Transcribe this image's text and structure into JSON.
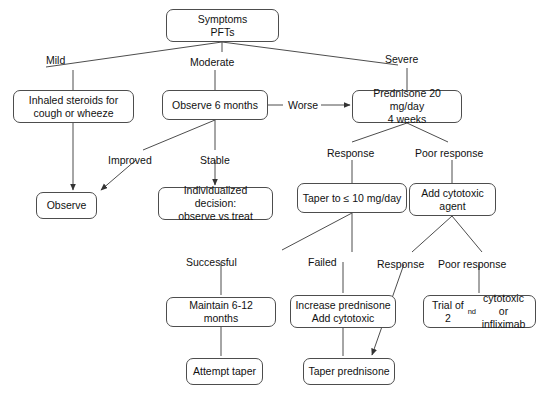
{
  "diagram": {
    "stroke_color": "#4d4d4d",
    "text_color": "#111111",
    "background": "#ffffff",
    "nodes": [
      {
        "id": "symptoms",
        "label": "Symptoms\nPFTs",
        "x": 166,
        "y": 9,
        "w": 113,
        "h": 33
      },
      {
        "id": "inhaled",
        "label": "Inhaled steroids for\ncough or wheeze",
        "x": 13,
        "y": 90,
        "w": 121,
        "h": 33
      },
      {
        "id": "observe6",
        "label": "Observe 6 months",
        "x": 162,
        "y": 90,
        "w": 106,
        "h": 30
      },
      {
        "id": "prednisone",
        "label": "Prednisone 20 mg/day\n4 weeks",
        "x": 352,
        "y": 90,
        "w": 110,
        "h": 33
      },
      {
        "id": "observe",
        "label": "Observe",
        "x": 36,
        "y": 192,
        "w": 61,
        "h": 27
      },
      {
        "id": "individual",
        "label": "Individualized decision:\nobserve vs treat",
        "x": 158,
        "y": 187,
        "w": 115,
        "h": 33
      },
      {
        "id": "taper10",
        "label": "Taper to ≤ 10 mg/day",
        "x": 297,
        "y": 183,
        "w": 110,
        "h": 30
      },
      {
        "id": "addcyto",
        "label": "Add cytotoxic\nagent",
        "x": 409,
        "y": 183,
        "w": 87,
        "h": 33
      },
      {
        "id": "maintain",
        "label": "Maintain 6-12 months",
        "x": 166,
        "y": 297,
        "w": 110,
        "h": 30
      },
      {
        "id": "increase",
        "label": "Increase prednisone\nAdd cytotoxic",
        "x": 290,
        "y": 295,
        "w": 106,
        "h": 33
      },
      {
        "id": "trial2nd",
        "label": "Trial of 2|nd| cytotoxic\nor infliximab",
        "x": 423,
        "y": 295,
        "w": 113,
        "h": 33
      },
      {
        "id": "attempt",
        "label": "Attempt taper",
        "x": 186,
        "y": 358,
        "w": 77,
        "h": 27
      },
      {
        "id": "taperpred",
        "label": "Taper prednisone",
        "x": 303,
        "y": 358,
        "w": 92,
        "h": 27
      }
    ],
    "edge_labels": [
      {
        "id": "mild",
        "text": "Mild",
        "x": 46,
        "y": 54
      },
      {
        "id": "moderate",
        "text": "Moderate",
        "x": 190,
        "y": 56
      },
      {
        "id": "severe",
        "text": "Severe",
        "x": 385,
        "y": 53
      },
      {
        "id": "worse",
        "text": "Worse",
        "x": 288,
        "y": 99
      },
      {
        "id": "improved",
        "text": "Improved",
        "x": 108,
        "y": 154
      },
      {
        "id": "stable",
        "text": "Stable",
        "x": 200,
        "y": 154
      },
      {
        "id": "response1",
        "text": "Response",
        "x": 327,
        "y": 147
      },
      {
        "id": "poorresponse1",
        "text": "Poor response",
        "x": 415,
        "y": 147
      },
      {
        "id": "successful",
        "text": "Successful",
        "x": 186,
        "y": 256
      },
      {
        "id": "failed",
        "text": "Failed",
        "x": 308,
        "y": 256
      },
      {
        "id": "response2",
        "text": "Response",
        "x": 377,
        "y": 258
      },
      {
        "id": "poorresponse2",
        "text": "Poor response",
        "x": 438,
        "y": 258
      }
    ]
  }
}
